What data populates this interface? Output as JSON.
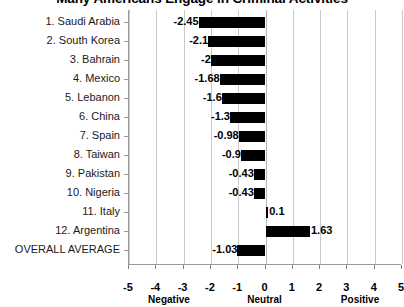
{
  "chart_data": {
    "type": "bar",
    "orientation": "horizontal",
    "title": "Many Americans Engage in Criminal Activities",
    "xlabel": "",
    "ylabel": "",
    "xlim": [
      -5,
      5
    ],
    "grid": true,
    "legend": null,
    "categories": [
      "1. Saudi Arabia",
      "2. South Korea",
      "3. Bahrain",
      "4. Mexico",
      "5. Lebanon",
      "6. China",
      "7. Spain",
      "8. Taiwan",
      "9. Pakistan",
      "10. Nigeria",
      "11. Italy",
      "12. Argentina",
      "OVERALL AVERAGE"
    ],
    "values": [
      -2.45,
      -2.1,
      -2,
      -1.68,
      -1.6,
      -1.3,
      -0.98,
      -0.9,
      -0.43,
      -0.43,
      0.1,
      1.63,
      -1.03
    ],
    "value_labels": [
      "-2.45",
      "-2.1",
      "-2",
      "-1.68",
      "-1.6",
      "-1.3",
      "-0.98",
      "-0.9",
      "-0.43",
      "-0.43",
      "0.1",
      "1.63",
      "-1.03"
    ],
    "xticks": [
      -5,
      -4,
      -3,
      -2,
      -1,
      0,
      1,
      2,
      3,
      4,
      5
    ],
    "xtick_labels": [
      "-5",
      "-4",
      "-3",
      "-2",
      "-1",
      "0",
      "1",
      "2",
      "3",
      "4",
      "5"
    ],
    "x_group_labels": [
      {
        "text": "Negative",
        "at": -3.5
      },
      {
        "text": "Neutral",
        "at": 0
      },
      {
        "text": "Positive",
        "at": 3.5
      }
    ],
    "bar_color": "#000000",
    "grid_color": "#c9c9c9",
    "axis_color": "#9a9a9a",
    "background_color": "#ffffff"
  }
}
